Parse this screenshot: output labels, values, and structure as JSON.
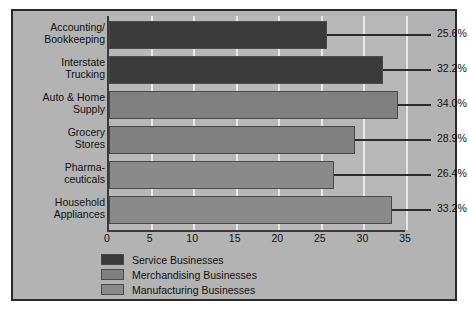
{
  "chart_data": {
    "type": "bar",
    "orientation": "horizontal",
    "title": "",
    "xlabel": "",
    "ylabel": "",
    "xlim": [
      0,
      35
    ],
    "xticks": [
      0,
      5,
      10,
      15,
      20,
      25,
      30,
      35
    ],
    "grid": true,
    "legend_position": "bottom-left",
    "categories": [
      "Accounting/\nBookkeeping",
      "Interstate\nTrucking",
      "Auto & Home\nSupply",
      "Grocery\nStores",
      "Pharma-\nceuticals",
      "Household\nAppliances"
    ],
    "values": [
      25.6,
      32.2,
      34.0,
      28.9,
      26.4,
      33.2
    ],
    "value_labels": [
      "25.6%",
      "32.2%",
      "34.0%",
      "28.9%",
      "26.4%",
      "33.2%"
    ],
    "series_of_bar": [
      "Service Businesses",
      "Service Businesses",
      "Merchandising Businesses",
      "Merchandising Businesses",
      "Manufacturing Businesses",
      "Manufacturing Businesses"
    ],
    "legend": [
      {
        "label": "Service Businesses",
        "color": "#3a3a3a"
      },
      {
        "label": "Merchandising Businesses",
        "color": "#808080"
      },
      {
        "label": "Manufacturing Businesses",
        "color": "#8a8a8a"
      }
    ]
  },
  "colors": {
    "figure_background": "#b3b3b3",
    "plot_background": "#b8b8b8",
    "gridline": "#e8e8e8",
    "axis": "#3a3a3a",
    "text": "#111111",
    "bar_dark": "#3a3a3a",
    "bar_medium": "#808080",
    "bar_light": "#8a8a8a"
  }
}
